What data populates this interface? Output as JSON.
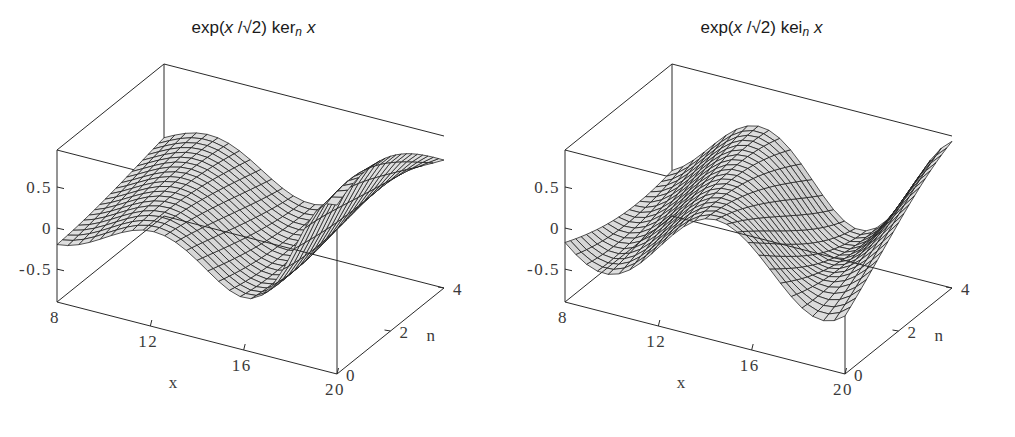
{
  "figure": {
    "background": "#ffffff",
    "width": 1015,
    "height": 437,
    "panel_count": 2
  },
  "chart_data": [
    {
      "type": "surface",
      "panel": "left",
      "title": "exp(x /√2) ker_n x",
      "title_parts": {
        "prefix": "exp(",
        "var": "x",
        "over": " /√2) ",
        "func": "ker",
        "sub": "n",
        "arg": "x"
      },
      "xlabel": "x",
      "ylabel": "n",
      "zlabel": "",
      "xlim": [
        8,
        20
      ],
      "ylim": [
        0,
        4
      ],
      "zlim": [
        -0.9,
        0.95
      ],
      "xticks": [
        8,
        12,
        16,
        20
      ],
      "xticklabels": [
        "8",
        "12",
        "16",
        "20"
      ],
      "yticks": [
        0,
        2,
        4
      ],
      "yticklabels": [
        "0",
        "2",
        "4"
      ],
      "zticks": [
        -0.5,
        0,
        0.5
      ],
      "zticklabels": [
        "-0.5",
        "0",
        "0.5"
      ],
      "grid": false,
      "legend": "none",
      "mesh": {
        "nx": 26,
        "ny": 20,
        "shading": "grayscale",
        "wireframe": true
      },
      "description": "Kelvin function ker_n(x) scaled by exp(x/sqrt2): sharp ridge near x=8 decaying into damped oscillation along x, with a secondary crest at larger n.",
      "surface_params": {
        "amp": 0.95,
        "decay": 0.0,
        "phase": 0.55,
        "freq": 0.72,
        "n_shift": 0.38,
        "ridge": 1.0
      }
    },
    {
      "type": "surface",
      "panel": "right",
      "title": "exp(x /√2) kei_n x",
      "title_parts": {
        "prefix": "exp(",
        "var": "x",
        "over": " /√2) ",
        "func": "kei",
        "sub": "n",
        "arg": "x"
      },
      "xlabel": "x",
      "ylabel": "n",
      "zlabel": "",
      "xlim": [
        8,
        20
      ],
      "ylim": [
        0,
        4
      ],
      "zlim": [
        -0.9,
        0.95
      ],
      "xticks": [
        8,
        12,
        16,
        20
      ],
      "xticklabels": [
        "8",
        "12",
        "16",
        "20"
      ],
      "yticks": [
        0,
        2,
        4
      ],
      "yticklabels": [
        "0",
        "2",
        "4"
      ],
      "zticks": [
        -0.5,
        0,
        0.5
      ],
      "zticklabels": [
        "-0.5",
        "0",
        "0.5"
      ],
      "grid": false,
      "legend": "none",
      "mesh": {
        "nx": 26,
        "ny": 20,
        "shading": "grayscale",
        "wireframe": true
      },
      "description": "Kelvin function kei_n(x) scaled by exp(x/sqrt2): two smooth rounded crests separated by a trough, damped oscillation along x.",
      "surface_params": {
        "amp": 0.95,
        "decay": 0.0,
        "phase": 2.15,
        "freq": 0.72,
        "n_shift": 0.38,
        "ridge": 0.0
      }
    }
  ]
}
